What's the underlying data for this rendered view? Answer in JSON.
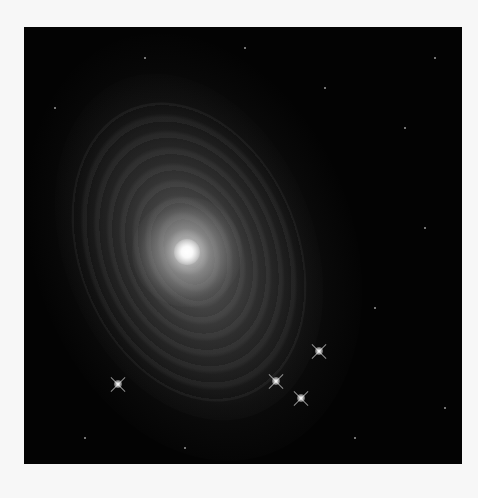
{
  "image": {
    "subject": "spiral galaxy",
    "background_color": "#f7f7f7",
    "photo_background": "#030303"
  },
  "stars": [
    {
      "x": 295,
      "y": 324
    },
    {
      "x": 252,
      "y": 354
    },
    {
      "x": 277,
      "y": 371
    },
    {
      "x": 94,
      "y": 357
    }
  ],
  "specks": [
    {
      "x": 220,
      "y": 20
    },
    {
      "x": 300,
      "y": 60
    },
    {
      "x": 380,
      "y": 100
    },
    {
      "x": 400,
      "y": 200
    },
    {
      "x": 350,
      "y": 280
    },
    {
      "x": 420,
      "y": 380
    },
    {
      "x": 60,
      "y": 410
    },
    {
      "x": 160,
      "y": 420
    },
    {
      "x": 330,
      "y": 410
    },
    {
      "x": 30,
      "y": 80
    },
    {
      "x": 120,
      "y": 30
    },
    {
      "x": 410,
      "y": 30
    }
  ]
}
